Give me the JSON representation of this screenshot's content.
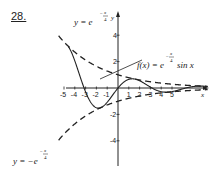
{
  "problem": {
    "number": "28."
  },
  "chart_data": {
    "type": "line",
    "title": "",
    "xlabel": "x",
    "ylabel": "y",
    "x_ticks": [
      "-5",
      "-4",
      "-3",
      "-2",
      "-1",
      "1",
      "2",
      "3",
      "4",
      "5"
    ],
    "y_ticks": [
      "4",
      "2",
      "-2",
      "-4"
    ],
    "xlim": [
      -5.5,
      8.5
    ],
    "ylim": [
      -5,
      5
    ],
    "series": [
      {
        "name": "f(x) = e^(-x/4) sin x",
        "style": "solid",
        "formula": "exp(-x/4)*sin(x)",
        "domain": [
          -4.6,
          8.3
        ]
      },
      {
        "name": "y = e^(-x/4)",
        "style": "dashed",
        "formula": "exp(-x/4)",
        "domain": [
          -5.5,
          8.3
        ]
      },
      {
        "name": "y = -e^(-x/4)",
        "style": "dashed",
        "formula": "-exp(-x/4)",
        "domain": [
          -5.5,
          8.3
        ]
      }
    ],
    "annotations": [
      {
        "text": "y = e^(-x/4)",
        "points_to": "upper dashed envelope"
      },
      {
        "text": "f(x) = e^(-x/4) sin x",
        "points_to": "solid curve"
      },
      {
        "text": "y = -e^(-x/4)",
        "points_to": "lower dashed envelope"
      }
    ],
    "grid": false,
    "legend": "none"
  },
  "labels": {
    "upper_envelope": {
      "lhs": "y = e",
      "exp_num": "x",
      "exp_den": "4"
    },
    "function": {
      "lhs": "f(x) = e",
      "exp_num": "x",
      "exp_den": "4",
      "rhs": "sin x"
    },
    "lower_envelope": {
      "lhs": "y = −e",
      "exp_num": "x",
      "exp_den": "4"
    },
    "x_axis": "x",
    "y_axis": "y"
  },
  "ticks": {
    "x": [
      {
        "label": "-5",
        "v": -5
      },
      {
        "label": "-4",
        "v": -4
      },
      {
        "label": "-3",
        "v": -3
      },
      {
        "label": "-2",
        "v": -2
      },
      {
        "label": "-1",
        "v": -1
      },
      {
        "label": "1",
        "v": 1
      },
      {
        "label": "2",
        "v": 2
      },
      {
        "label": "3",
        "v": 3
      },
      {
        "label": "4",
        "v": 4
      },
      {
        "label": "5",
        "v": 5
      }
    ],
    "y": [
      {
        "label": "4",
        "v": 4
      },
      {
        "label": "2",
        "v": 2
      },
      {
        "label": "-2",
        "v": -2
      },
      {
        "label": "-4",
        "v": -4
      }
    ]
  }
}
